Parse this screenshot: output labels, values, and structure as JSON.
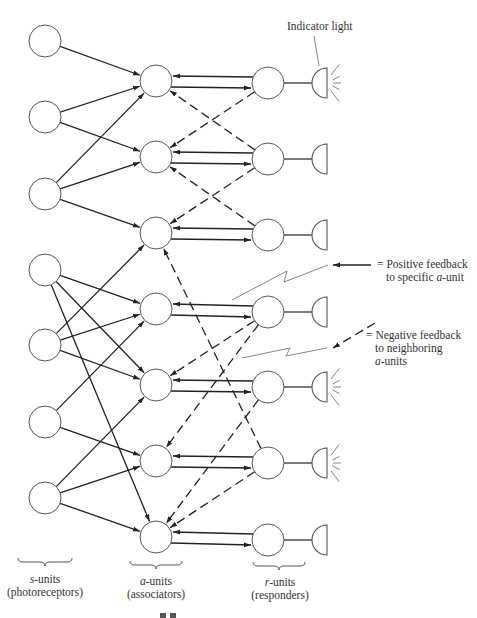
{
  "figure": {
    "units": {
      "s_units": {
        "label_prefix": "s",
        "label_suffix": "-units",
        "sublabel": "(photoreceptors)",
        "x": 45,
        "y": [
          41,
          117,
          194,
          270,
          345,
          422,
          498
        ]
      },
      "a_units": {
        "label_prefix": "a",
        "label_suffix": "-units",
        "sublabel": "(associators)",
        "x": 156,
        "y": [
          81,
          157,
          233,
          309,
          385,
          461,
          537
        ]
      },
      "r_units": {
        "label_prefix": "r",
        "label_suffix": "-units",
        "sublabel": "(responders)",
        "x": 268,
        "y": [
          83,
          159,
          235,
          312,
          387,
          463,
          540
        ]
      }
    },
    "indicator_lights": {
      "x": 327,
      "lit": [
        true,
        false,
        false,
        false,
        true,
        true,
        false
      ]
    },
    "s_to_a_connections": [
      [
        1,
        1
      ],
      [
        2,
        1
      ],
      [
        2,
        2
      ],
      [
        3,
        1
      ],
      [
        3,
        2
      ],
      [
        3,
        3
      ],
      [
        4,
        4
      ],
      [
        4,
        5
      ],
      [
        4,
        7
      ],
      [
        5,
        3
      ],
      [
        5,
        4
      ],
      [
        5,
        5
      ],
      [
        6,
        4
      ],
      [
        6,
        6
      ],
      [
        7,
        5
      ],
      [
        7,
        6
      ],
      [
        7,
        7
      ]
    ],
    "negative_feedback": [
      [
        1,
        2
      ],
      [
        2,
        1
      ],
      [
        2,
        3
      ],
      [
        3,
        2
      ],
      [
        4,
        5
      ],
      [
        4,
        6
      ],
      [
        5,
        7
      ],
      [
        6,
        7
      ],
      [
        6,
        3
      ]
    ],
    "annotations": {
      "indicator": "Indicator light",
      "positive_eq": "=",
      "positive_line1": "Positive feedback",
      "positive_line2_pre": "to specific ",
      "positive_line2_it": "a",
      "positive_line2_post": "-unit",
      "negative_eq": "=",
      "negative_line1": "Negative feedback",
      "negative_line2": "to neighboring",
      "negative_line3_it": "a",
      "negative_line3_post": "-units"
    }
  }
}
